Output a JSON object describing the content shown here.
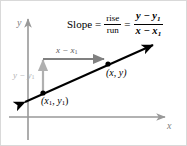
{
  "figure": {
    "background_color": "#ffffff",
    "border_color": "#d9d9d9"
  },
  "formula": {
    "slope_word": "Slope",
    "equals_1": "=",
    "rise": "rise",
    "run": "run",
    "equals_2": "=",
    "numerator": "y − y",
    "numerator_sub": "1",
    "denominator": "x − x",
    "denominator_sub": "1"
  },
  "axes": {
    "y_label": "y",
    "x_label": "x",
    "color": "#999999",
    "origin_x": 27,
    "origin_y": 116
  },
  "line": {
    "color": "#000000",
    "start_x": 20,
    "start_y": 103,
    "end_x": 155,
    "end_y": 42,
    "double_arrow": true
  },
  "points": [
    {
      "name": "point-1",
      "label_prefix": "(x",
      "label_sub1": "1",
      "label_mid": ", y",
      "label_sub2": "1",
      "label_suffix": ")",
      "cx": 42,
      "cy": 92
    },
    {
      "name": "point-2",
      "label": "(x, y)",
      "cx": 107,
      "cy": 63
    }
  ],
  "run_arrow": {
    "label_prefix": "x − x",
    "label_sub": "1",
    "color": "#808080",
    "from_x": 42,
    "to_x": 107,
    "y": 58
  },
  "rise_arrow": {
    "label_prefix": "y − y",
    "label_sub": "1",
    "color": "#b3b3b3",
    "x": 42,
    "from_y": 92,
    "to_y": 56
  }
}
